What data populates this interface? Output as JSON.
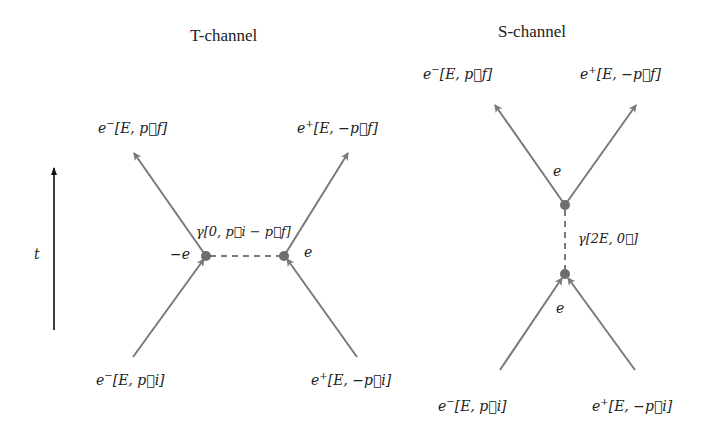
{
  "colors": {
    "line": "#7a7a7a",
    "vertex": "#6e6e6e",
    "text": "#222222",
    "axis": "#111111"
  },
  "t_channel": {
    "title": "T-channel",
    "out_left": {
      "particle": "e",
      "charge": "−",
      "momentum": "[E, p⃗f]"
    },
    "out_right": {
      "particle": "e",
      "charge": "+",
      "momentum": "[E, −p⃗f]"
    },
    "in_left": {
      "particle": "e",
      "charge": "−",
      "momentum": "[E, p⃗i]"
    },
    "in_right": {
      "particle": "e",
      "charge": "+",
      "momentum": "[E, −p⃗i]"
    },
    "photon_label": "γ[0, p⃗i − p⃗f]",
    "vertex_left_label": "−e",
    "vertex_right_label": "e"
  },
  "s_channel": {
    "title": "S-channel",
    "out_left": {
      "particle": "e",
      "charge": "−",
      "momentum": "[E, p⃗f]"
    },
    "out_right": {
      "particle": "e",
      "charge": "+",
      "momentum": "[E, −p⃗f]"
    },
    "in_left": {
      "particle": "e",
      "charge": "−",
      "momentum": "[E, p⃗i]"
    },
    "in_right": {
      "particle": "e",
      "charge": "+",
      "momentum": "[E, −p⃗i]"
    },
    "photon_label": "γ[2E, 0⃗]",
    "vertex_top_label": "e",
    "vertex_bottom_label": "e"
  },
  "time_axis": {
    "label": "t"
  }
}
